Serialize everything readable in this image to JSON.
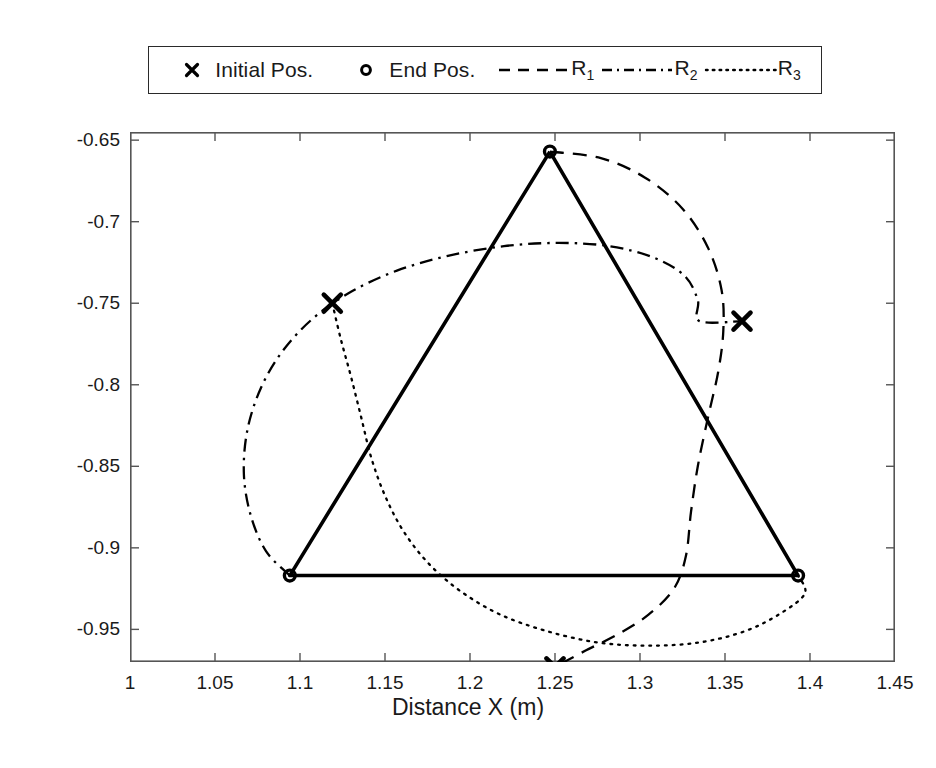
{
  "legend": {
    "entries": [
      {
        "label": "Initial Pos.",
        "symbol": "x-marker",
        "name": "legend-initial-pos"
      },
      {
        "label": "End Pos.",
        "symbol": "circle-marker",
        "name": "legend-end-pos"
      },
      {
        "label": "R",
        "sub": "1",
        "symbol": "dashed-line",
        "name": "legend-r1"
      },
      {
        "label": "R",
        "sub": "2",
        "symbol": "dashdot-line",
        "name": "legend-r2"
      },
      {
        "label": "R",
        "sub": "3",
        "symbol": "dotted-line",
        "name": "legend-r3"
      }
    ]
  },
  "chart_data": {
    "type": "scatter",
    "title": "",
    "xlabel": "Distance X (m)",
    "ylabel": "Distance Y (m)",
    "xlim": [
      1.0,
      1.45
    ],
    "ylim": [
      -0.97,
      -0.645
    ],
    "xticks": [
      "1",
      "1.05",
      "1.1",
      "1.15",
      "1.2",
      "1.25",
      "1.3",
      "1.35",
      "1.4",
      "1.45"
    ],
    "xtick_values": [
      1.0,
      1.05,
      1.1,
      1.15,
      1.2,
      1.25,
      1.3,
      1.35,
      1.4,
      1.45
    ],
    "yticks": [
      "-0.65",
      "-0.7",
      "-0.75",
      "-0.8",
      "-0.85",
      "-0.9",
      "-0.95"
    ],
    "ytick_values": [
      -0.65,
      -0.7,
      -0.75,
      -0.8,
      -0.85,
      -0.9,
      -0.95
    ],
    "grid": false,
    "legend_position": "above-axes",
    "series": [
      {
        "name": "Initial Pos.",
        "type": "scatter",
        "marker": "x",
        "points": [
          {
            "x": 1.119,
            "y": -0.75
          },
          {
            "x": 1.36,
            "y": -0.761
          },
          {
            "x": 1.25,
            "y": -0.973
          }
        ]
      },
      {
        "name": "End Pos.",
        "type": "scatter",
        "marker": "o",
        "points": [
          {
            "x": 1.247,
            "y": -0.657
          },
          {
            "x": 1.094,
            "y": -0.917
          },
          {
            "x": 1.393,
            "y": -0.917
          }
        ]
      },
      {
        "name": "Formation Triangle",
        "type": "line",
        "style": "solid",
        "points": [
          {
            "x": 1.247,
            "y": -0.657
          },
          {
            "x": 1.094,
            "y": -0.917
          },
          {
            "x": 1.393,
            "y": -0.917
          },
          {
            "x": 1.247,
            "y": -0.657
          }
        ]
      },
      {
        "name": "R1",
        "type": "line",
        "style": "dashed",
        "points": [
          {
            "x": 1.247,
            "y": -0.657
          },
          {
            "x": 1.277,
            "y": -0.661
          },
          {
            "x": 1.303,
            "y": -0.673
          },
          {
            "x": 1.325,
            "y": -0.692
          },
          {
            "x": 1.34,
            "y": -0.716
          },
          {
            "x": 1.348,
            "y": -0.742
          },
          {
            "x": 1.349,
            "y": -0.767
          },
          {
            "x": 1.346,
            "y": -0.792
          },
          {
            "x": 1.34,
            "y": -0.82
          },
          {
            "x": 1.334,
            "y": -0.85
          },
          {
            "x": 1.33,
            "y": -0.878
          },
          {
            "x": 1.327,
            "y": -0.905
          },
          {
            "x": 1.32,
            "y": -0.925
          },
          {
            "x": 1.305,
            "y": -0.941
          },
          {
            "x": 1.287,
            "y": -0.953
          },
          {
            "x": 1.268,
            "y": -0.963
          },
          {
            "x": 1.25,
            "y": -0.973
          }
        ]
      },
      {
        "name": "R2",
        "type": "line",
        "style": "dashdot",
        "points": [
          {
            "x": 1.094,
            "y": -0.917
          },
          {
            "x": 1.08,
            "y": -0.902
          },
          {
            "x": 1.071,
            "y": -0.88
          },
          {
            "x": 1.067,
            "y": -0.855
          },
          {
            "x": 1.069,
            "y": -0.828
          },
          {
            "x": 1.077,
            "y": -0.802
          },
          {
            "x": 1.09,
            "y": -0.779
          },
          {
            "x": 1.108,
            "y": -0.759
          },
          {
            "x": 1.13,
            "y": -0.743
          },
          {
            "x": 1.157,
            "y": -0.73
          },
          {
            "x": 1.187,
            "y": -0.721
          },
          {
            "x": 1.22,
            "y": -0.715
          },
          {
            "x": 1.252,
            "y": -0.713
          },
          {
            "x": 1.282,
            "y": -0.715
          },
          {
            "x": 1.308,
            "y": -0.722
          },
          {
            "x": 1.326,
            "y": -0.733
          },
          {
            "x": 1.334,
            "y": -0.748
          },
          {
            "x": 1.335,
            "y": -0.761
          },
          {
            "x": 1.36,
            "y": -0.761
          }
        ]
      },
      {
        "name": "R3",
        "type": "line",
        "style": "dotted",
        "points": [
          {
            "x": 1.119,
            "y": -0.75
          },
          {
            "x": 1.124,
            "y": -0.772
          },
          {
            "x": 1.13,
            "y": -0.795
          },
          {
            "x": 1.136,
            "y": -0.82
          },
          {
            "x": 1.142,
            "y": -0.845
          },
          {
            "x": 1.15,
            "y": -0.868
          },
          {
            "x": 1.161,
            "y": -0.89
          },
          {
            "x": 1.176,
            "y": -0.91
          },
          {
            "x": 1.195,
            "y": -0.927
          },
          {
            "x": 1.218,
            "y": -0.941
          },
          {
            "x": 1.245,
            "y": -0.951
          },
          {
            "x": 1.275,
            "y": -0.958
          },
          {
            "x": 1.305,
            "y": -0.96
          },
          {
            "x": 1.335,
            "y": -0.958
          },
          {
            "x": 1.362,
            "y": -0.951
          },
          {
            "x": 1.383,
            "y": -0.94
          },
          {
            "x": 1.397,
            "y": -0.928
          },
          {
            "x": 1.393,
            "y": -0.917
          }
        ]
      }
    ]
  }
}
